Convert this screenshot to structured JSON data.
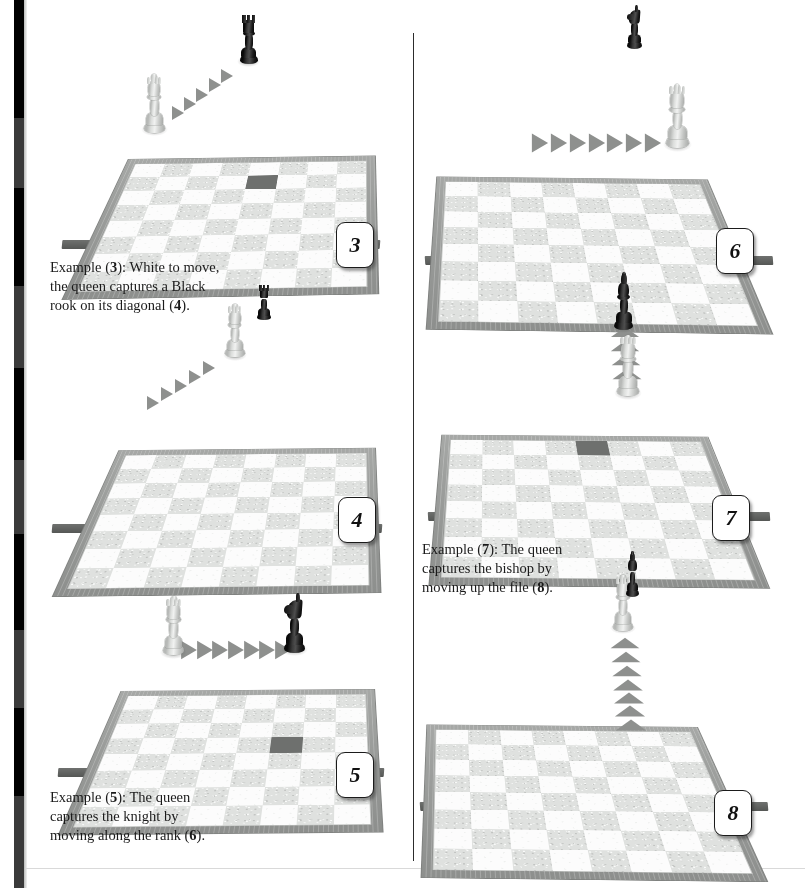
{
  "page": {
    "kind": "chess-instruction-book-page",
    "background_color": "#ffffff",
    "divider_color": "#2c2c2c",
    "frame_color": "#9a9c9a",
    "light_square_color": "#fcfcfc",
    "dark_square_color": "#dfe1df",
    "arrow_color": "#8e908e",
    "white_piece_color": "#d5d7d5",
    "black_piece_color": "#111111"
  },
  "scan_bar": {
    "segments": [
      {
        "top": 0,
        "height": 118,
        "color": "#000000"
      },
      {
        "top": 118,
        "height": 70,
        "color": "#3a3a3a"
      },
      {
        "top": 188,
        "height": 98,
        "color": "#000000"
      },
      {
        "top": 286,
        "height": 82,
        "color": "#3a3a3a"
      },
      {
        "top": 368,
        "height": 92,
        "color": "#000000"
      },
      {
        "top": 460,
        "height": 74,
        "color": "#3a3a3a"
      },
      {
        "top": 534,
        "height": 96,
        "color": "#000000"
      },
      {
        "top": 630,
        "height": 78,
        "color": "#3a3a3a"
      },
      {
        "top": 708,
        "height": 88,
        "color": "#000000"
      },
      {
        "top": 796,
        "height": 92,
        "color": "#3a3a3a"
      }
    ]
  },
  "figures": [
    {
      "id": "figure-3",
      "badge": "3",
      "move_type": "diagonal",
      "description": "White queen on a light square with diagonal arrows pointing up-right toward a Black rook",
      "arrow_count": 5,
      "pieces": [
        {
          "name": "white-queen",
          "color": "white",
          "type": "queen"
        },
        {
          "name": "black-rook",
          "color": "black",
          "type": "rook"
        }
      ]
    },
    {
      "id": "figure-6",
      "badge": "6",
      "move_type": "rank",
      "description": "White queen has captured the knight and now stands on the knight's square; arrows trail along the rank",
      "arrow_count": 7,
      "pieces": [
        {
          "name": "white-queen",
          "color": "white",
          "type": "queen"
        },
        {
          "name": "black-knight",
          "color": "black",
          "type": "knight"
        }
      ]
    },
    {
      "id": "figure-4",
      "badge": "4",
      "move_type": "diagonal",
      "description": "White queen has captured the rook and stands on the rook's square; diagonal arrow trail behind it",
      "arrow_count": 5,
      "pieces": [
        {
          "name": "white-queen",
          "color": "white",
          "type": "queen"
        },
        {
          "name": "black-rook",
          "color": "black",
          "type": "rook"
        }
      ]
    },
    {
      "id": "figure-7",
      "badge": "7",
      "move_type": "file",
      "description": "White queen below a Black bishop on a dark square, with arrows pointing up the file",
      "arrow_count": 4,
      "pieces": [
        {
          "name": "white-queen",
          "color": "white",
          "type": "queen"
        },
        {
          "name": "black-bishop",
          "color": "black",
          "type": "bishop"
        }
      ]
    },
    {
      "id": "figure-5",
      "badge": "5",
      "move_type": "rank",
      "description": "White queen on the left with arrows pointing right toward a Black knight on a dark square",
      "arrow_count": 7,
      "pieces": [
        {
          "name": "white-queen",
          "color": "white",
          "type": "queen"
        },
        {
          "name": "black-knight",
          "color": "black",
          "type": "knight"
        }
      ]
    },
    {
      "id": "figure-8",
      "badge": "8",
      "move_type": "file",
      "description": "White queen has captured the bishop and stands on the bishop's square; arrows trail up the file",
      "arrow_count": 7,
      "pieces": [
        {
          "name": "white-queen",
          "color": "white",
          "type": "queen"
        },
        {
          "name": "black-bishop",
          "color": "black",
          "type": "bishop"
        }
      ]
    }
  ],
  "captions": {
    "caption_3": {
      "line1_a": "Example (",
      "line1_b": "3",
      "line1_c": "): White to move,",
      "line2": "the queen captures a Black",
      "line3_a": "rook on its diagonal (",
      "line3_b": "4",
      "line3_c": ")."
    },
    "caption_5": {
      "line1_a": "Example (",
      "line1_b": "5",
      "line1_c": "): The queen",
      "line2": "captures the knight by",
      "line3_a": "moving along the rank (",
      "line3_b": "6",
      "line3_c": ")."
    },
    "caption_7": {
      "line1_a": "Example (",
      "line1_b": "7",
      "line1_c": "): The queen",
      "line2": "captures the bishop by",
      "line3_a": "moving up the file (",
      "line3_b": "8",
      "line3_c": ")."
    }
  }
}
